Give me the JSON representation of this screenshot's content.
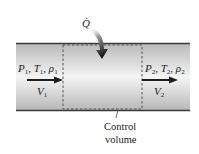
{
  "diagram": {
    "heat_label": "Q̇",
    "inlet": {
      "state_label": {
        "P": "P",
        "P_sub": "1",
        "T": "T",
        "T_sub": "1",
        "rho": "ρ",
        "rho_sub": "1"
      },
      "velocity": {
        "V": "V",
        "V_sub": "1"
      }
    },
    "outlet": {
      "state_label": {
        "P": "P",
        "P_sub": "2",
        "T": "T",
        "T_sub": "2",
        "rho": "ρ",
        "rho_sub": "2"
      },
      "velocity": {
        "V": "V",
        "V_sub": "2"
      }
    },
    "control_volume": {
      "line1": "Control",
      "line2": "volume"
    },
    "colors": {
      "pipe_edge": "#3a3a3a",
      "pipe_shade": "#c8c8c8",
      "pipe_light": "#f2f2f2",
      "arrow": "#1e1e1e"
    }
  }
}
